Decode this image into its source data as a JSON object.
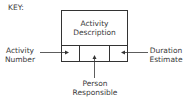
{
  "key_label": "KEY:",
  "box": {
    "top_line1": "Activity",
    "top_line2": "Description"
  },
  "labels": {
    "activity_number": [
      "Activity",
      "Number"
    ],
    "duration_estimate": [
      "Duration",
      "Estimate"
    ],
    "person_responsible": [
      "Person",
      "Responsible"
    ]
  },
  "colors": {
    "line": "#333333",
    "text": "#3a3a3a"
  }
}
